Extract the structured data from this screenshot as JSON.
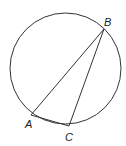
{
  "diagram": {
    "type": "circle-inscribed-triangle",
    "circle": {
      "cx": 65.5,
      "cy": 68.5,
      "r": 55.5
    },
    "points": [
      {
        "name": "A",
        "x": 31,
        "y": 115,
        "label_x": 25,
        "label_y": 127
      },
      {
        "name": "B",
        "x": 104,
        "y": 29,
        "label_x": 104,
        "label_y": 25
      },
      {
        "name": "C",
        "x": 69,
        "y": 126,
        "label_x": 66,
        "label_y": 141
      }
    ],
    "segments": [
      {
        "from": "A",
        "to": "B"
      },
      {
        "from": "B",
        "to": "C"
      },
      {
        "from": "A",
        "to": "C"
      }
    ],
    "labels": {
      "a": "A",
      "b": "B",
      "c": "C"
    },
    "colors": {
      "stroke": "#333333",
      "label": "#222222"
    }
  }
}
